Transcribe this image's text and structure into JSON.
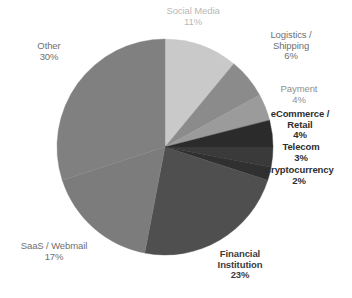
{
  "chart_data": {
    "type": "pie",
    "title": "",
    "subtitle": "",
    "xlabel": "",
    "ylabel": "",
    "legend_position": "labels-around-pie",
    "grid": false,
    "start_angle_deg": 0,
    "direction": "clockwise",
    "unit": "%",
    "categories": [
      "Social Media",
      "Logistics / Shipping",
      "Payment",
      "eCommerce / Retail",
      "Telecom",
      "Cryptocurrency",
      "Financial Institution",
      "SaaS / Webmail",
      "Other"
    ],
    "values": [
      11,
      6,
      4,
      4,
      3,
      2,
      23,
      17,
      30
    ],
    "slices": [
      {
        "name": "Social Media",
        "value": 11,
        "value_label": "11%",
        "color": "#c9c9c9",
        "label_style": "lab-light"
      },
      {
        "name": "Logistics / Shipping",
        "name_line1": "Logistics /",
        "name_line2": "Shipping",
        "value": 6,
        "value_label": "6%",
        "color": "#8b8b8b",
        "label_style": "lab-dark"
      },
      {
        "name": "Payment",
        "value": 4,
        "value_label": "4%",
        "color": "#9b9b9b",
        "label_style": "lab-mid"
      },
      {
        "name": "eCommerce / Retail",
        "name_line1": "eCommerce /",
        "name_line2": "Retail",
        "value": 4,
        "value_label": "4%",
        "color": "#2b2b2b",
        "label_style": "lab-bold"
      },
      {
        "name": "Telecom",
        "value": 3,
        "value_label": "3%",
        "color": "#3a3a3a",
        "label_style": "lab-bold"
      },
      {
        "name": "Cryptocurrency",
        "value": 2,
        "value_label": "2%",
        "color": "#303030",
        "label_style": "lab-bold"
      },
      {
        "name": "Financial Institution",
        "name_line1": "Financial",
        "name_line2": "Institution",
        "value": 23,
        "value_label": "23%",
        "color": "#4f4f4f",
        "label_style": "lab-boldmid"
      },
      {
        "name": "SaaS / Webmail",
        "value": 17,
        "value_label": "17%",
        "color": "#7c7c7c",
        "label_style": "lab-dark"
      },
      {
        "name": "Other",
        "value": 30,
        "value_label": "30%",
        "color": "#808080",
        "label_style": "lab-dark"
      }
    ]
  },
  "geometry": {
    "center_x": 165,
    "center_y": 147,
    "radius": 108
  }
}
